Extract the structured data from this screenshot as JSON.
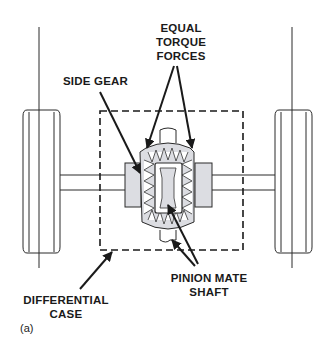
{
  "diagram": {
    "labels": {
      "equal_torque_forces": [
        "EQUAL",
        "TORQUE",
        "FORCES"
      ],
      "side_gear": "SIDE GEAR",
      "pinion_mate_shaft": [
        "PINION MATE",
        "SHAFT"
      ],
      "differential_case": [
        "DIFFERENTIAL",
        "CASE"
      ]
    },
    "caption": "(a)",
    "colors": {
      "line": "#1a1a1a",
      "gear_fill": "#dcdde2",
      "background": "#ffffff"
    }
  }
}
